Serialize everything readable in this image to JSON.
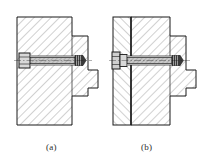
{
  "figure": {
    "kind": "engineering-section-drawing",
    "background_color": "#ffffff",
    "line_color": "#1a1a1a",
    "hatch_color": "#8a8a8a",
    "fastener_fill": "#b9b9b9",
    "subfigures": [
      {
        "id": "a",
        "caption": "(a)",
        "description": "Sectioned block with stepped boss and flat-head screw engaging a tapped hole",
        "parts": [
          "base-block",
          "stepped-boss",
          "flat-head-screw"
        ],
        "hatch_direction": "45-up-right",
        "split_line": false
      },
      {
        "id": "b",
        "caption": "(b)",
        "description": "Two-plate bolted joint, sectioned, with hex-head bolt through clearance hole into tapped boss",
        "parts": [
          "left-cover-plate",
          "base-block",
          "stepped-boss",
          "hex-head-bolt"
        ],
        "hatch_direction": "mixed-opposing",
        "split_line": true
      }
    ]
  },
  "captions": {
    "a": "(a)",
    "b": "(b)"
  }
}
